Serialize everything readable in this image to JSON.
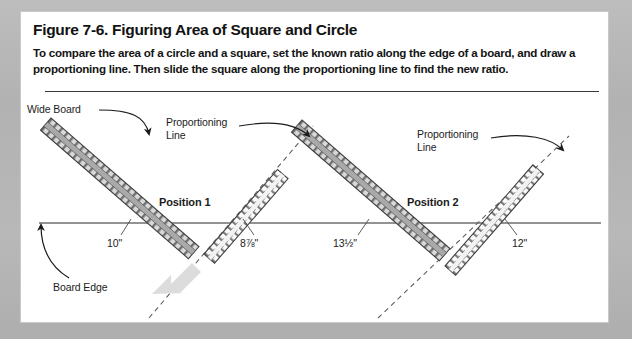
{
  "figure": {
    "title": "Figure 7-6. Figuring Area of Square and Circle",
    "intro": "To compare the area of a circle and a square, set the known ratio along the edge of a board, and draw a proportioning line. Then slide the square along the proportioning line to find the new ratio.",
    "colors": {
      "page_background": "#b5b5b5",
      "card_background": "#ffffff",
      "text": "#141414",
      "rule": "#3a3a3a",
      "board_edge_line": "#6b6b6b",
      "strip_fill": "#b3b3b3",
      "strip_outline": "#4a4a4a",
      "dashed_line": "#5a5a5a",
      "block_arrow": "#d6d6d6"
    }
  },
  "diagram": {
    "labels": [
      {
        "name": "wide-board",
        "text": "Wide Board"
      },
      {
        "name": "proportioning-line-1",
        "text": "Proportioning\nLine"
      },
      {
        "name": "proportioning-line-2",
        "text": "Proportioning\nLine"
      },
      {
        "name": "position-1",
        "text": "Position 1"
      },
      {
        "name": "position-2",
        "text": "Position 2"
      },
      {
        "name": "board-edge",
        "text": "Board Edge"
      }
    ],
    "measurements": [
      {
        "name": "measurement-10in",
        "text": "10\"",
        "position": "Position 1",
        "side": "left"
      },
      {
        "name": "measurement-8-7-8in",
        "text": "8⅞\"",
        "position": "Position 1",
        "side": "right"
      },
      {
        "name": "measurement-13-1-2in",
        "text": "13½\"",
        "position": "Position 2",
        "side": "left"
      },
      {
        "name": "measurement-12in",
        "text": "12\"",
        "position": "Position 2",
        "side": "right"
      }
    ],
    "annotations": {
      "wide_board": "Wide Board",
      "board_edge": "Board Edge",
      "position_1": "Position 1",
      "position_2": "Position 2",
      "proportioning_line_1": "Proportioning\nLine",
      "proportioning_line_2": "Proportioning\nLine",
      "meas_10": "10\"",
      "meas_878": "8⅞\"",
      "meas_1312": "13½\"",
      "meas_12": "12\""
    }
  }
}
